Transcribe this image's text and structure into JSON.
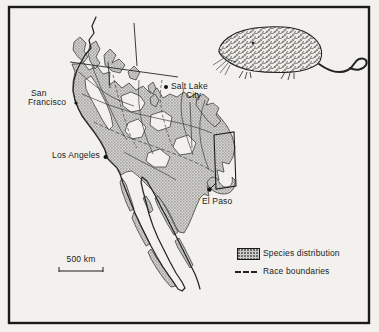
{
  "map": {
    "cities": {
      "san_francisco": {
        "line1": "San",
        "line2": "Francisco"
      },
      "salt_lake_city": {
        "line1": "Salt Lake",
        "line2": "City"
      },
      "los_angeles": "Los Angeles",
      "el_paso": "El Paso"
    },
    "scale_label": "500 km"
  },
  "legend": {
    "species_distribution": "Species distribution",
    "race_boundaries": "Race boundaries"
  },
  "colors": {
    "background": "#f2f1ed",
    "ink": "#1f1f1f",
    "shade_fill": "#b5b4b0"
  },
  "icons": {
    "gopher_illustration": "pocket-gopher-side-view",
    "city_marker": "filled-dot"
  }
}
